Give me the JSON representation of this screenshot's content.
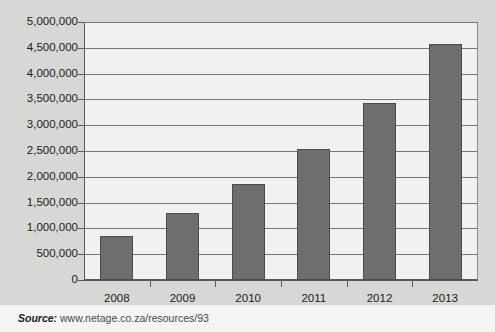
{
  "chart_data": {
    "type": "bar",
    "title": "",
    "subtitle": "",
    "xlabel": "",
    "ylabel": "",
    "categories": [
      "2008",
      "2009",
      "2010",
      "2011",
      "2012",
      "2013"
    ],
    "values": [
      850000,
      1300000,
      1860000,
      2540000,
      3430000,
      4570000
    ],
    "series": [
      {
        "name": "",
        "values": [
          850000,
          1300000,
          1860000,
          2540000,
          3430000,
          4570000
        ]
      }
    ],
    "ylim": [
      0,
      5000000
    ],
    "ytick_step": 500000,
    "ytick_labels": [
      "0",
      "500,000",
      "1,000,000",
      "1,500,000",
      "2,000,000",
      "2,500,000",
      "3,000,000",
      "3,500,000",
      "4,000,000",
      "4,500,000",
      "5,000,000"
    ],
    "ytick_values": [
      0,
      500000,
      1000000,
      1500000,
      2000000,
      2500000,
      3000000,
      3500000,
      4000000,
      4500000,
      5000000
    ],
    "grid": true,
    "grid_axis": "y",
    "legend": false,
    "legend_position": "none",
    "bar_color": "#6e6e6e",
    "bar_edge_color": "#4c4c4c",
    "plot_background": "#f1f1ef",
    "page_background": "#d7d7d5",
    "gridline_color": "#777777",
    "axis_color": "#5a5a5a",
    "text_color": "#1b1b1b"
  },
  "footer": {
    "source_label": "Source:",
    "source_url": "www.netage.co.za/resources/93"
  }
}
